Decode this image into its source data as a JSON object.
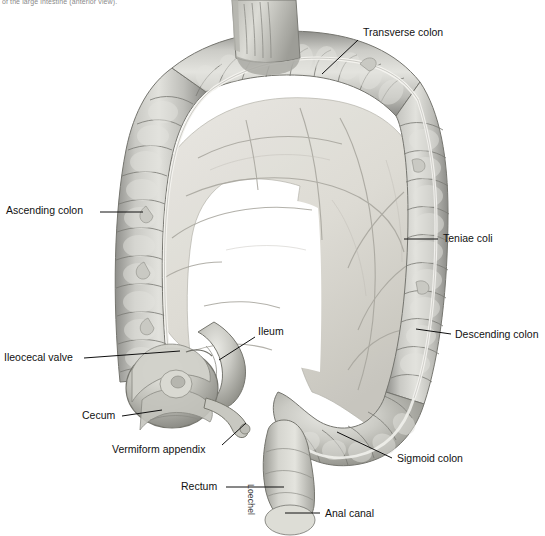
{
  "figure": {
    "caption": "of the large intestine (anterior view).",
    "artist_signature": "Loechel",
    "palette": {
      "background": "#ffffff",
      "leader_line": "#101010",
      "label_text": "#111111",
      "caption_text": "#8a8a8a",
      "colon_light": "#d8d8d4",
      "colon_mid": "#b8b8b4",
      "colon_dark": "#8e8e8a",
      "colon_outline": "#6f6f6c",
      "mesentery_light": "#e2e0da",
      "mesentery_mid": "#cfcdc6",
      "taenia_highlight": "#f2f1ec",
      "vessel": "#9a9a95",
      "inner_void": "#ffffff"
    }
  },
  "labels": [
    {
      "id": "transverse-colon",
      "text": "Transverse colon",
      "x": 363,
      "y": 27,
      "align": "left",
      "leader": {
        "x1": 358,
        "y1": 40,
        "x2": 322,
        "y2": 74
      }
    },
    {
      "id": "ascending-colon",
      "text": "Ascending colon",
      "x": 6,
      "y": 205,
      "align": "left",
      "leader": {
        "x1": 100,
        "y1": 212,
        "x2": 143,
        "y2": 212
      }
    },
    {
      "id": "teniae-coli",
      "text": "Teniae coli",
      "x": 443,
      "y": 233,
      "align": "left",
      "leader": {
        "x1": 438,
        "y1": 239,
        "x2": 404,
        "y2": 239
      }
    },
    {
      "id": "descending-colon",
      "text": "Descending colon",
      "x": 455,
      "y": 329,
      "align": "left",
      "leader": {
        "x1": 451,
        "y1": 334,
        "x2": 416,
        "y2": 329
      }
    },
    {
      "id": "ileum",
      "text": "Ileum",
      "x": 258,
      "y": 326,
      "align": "left",
      "leader": {
        "x1": 255,
        "y1": 337,
        "x2": 219,
        "y2": 360
      }
    },
    {
      "id": "ileocecal-valve",
      "text": "Ileocecal valve",
      "x": 4,
      "y": 352,
      "align": "left",
      "leader": {
        "x1": 84,
        "y1": 358,
        "x2": 180,
        "y2": 351
      }
    },
    {
      "id": "cecum",
      "text": "Cecum",
      "x": 82,
      "y": 410,
      "align": "left",
      "leader": {
        "x1": 122,
        "y1": 416,
        "x2": 162,
        "y2": 410
      }
    },
    {
      "id": "vermiform-appendix",
      "text": "Vermiform appendix",
      "x": 112,
      "y": 444,
      "align": "left",
      "leader": {
        "x1": 222,
        "y1": 445,
        "x2": 246,
        "y2": 423
      }
    },
    {
      "id": "sigmoid-colon",
      "text": "Sigmoid colon",
      "x": 397,
      "y": 453,
      "align": "left",
      "leader": {
        "x1": 392,
        "y1": 458,
        "x2": 337,
        "y2": 432
      }
    },
    {
      "id": "rectum",
      "text": "Rectum",
      "x": 181,
      "y": 481,
      "align": "left",
      "leader": {
        "x1": 226,
        "y1": 487,
        "x2": 284,
        "y2": 487
      }
    },
    {
      "id": "anal-canal",
      "text": "Anal canal",
      "x": 325,
      "y": 508,
      "align": "left",
      "leader": {
        "x1": 320,
        "y1": 513,
        "x2": 285,
        "y2": 513
      }
    }
  ]
}
